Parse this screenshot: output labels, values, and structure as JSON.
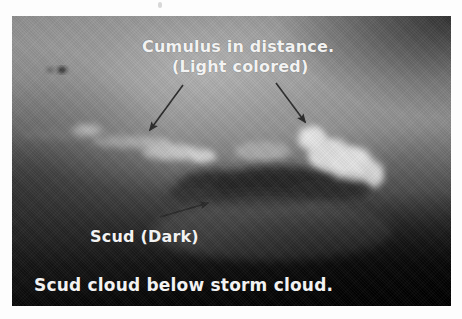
{
  "image": {
    "description": "Black and white photograph of dark scud cloud below a storm cloud with light-colored cumulus clouds in the distance",
    "border_color": "#ffffff",
    "text_color": "#f2f2f2",
    "arrow_color": "#2a2a2a"
  },
  "annotations": {
    "cumulus_line1": "Cumulus in distance.",
    "cumulus_line2": "(Light colored)",
    "scud_label": "Scud (Dark)",
    "caption": "Scud cloud below storm cloud."
  },
  "arrows": [
    {
      "name": "cumulus-left-arrow",
      "from": [
        171,
        69
      ],
      "to": [
        138,
        114
      ]
    },
    {
      "name": "cumulus-right-arrow",
      "from": [
        264,
        67
      ],
      "to": [
        293,
        106
      ]
    },
    {
      "name": "scud-arrow",
      "from": [
        148,
        201
      ],
      "to": [
        196,
        187
      ]
    }
  ]
}
